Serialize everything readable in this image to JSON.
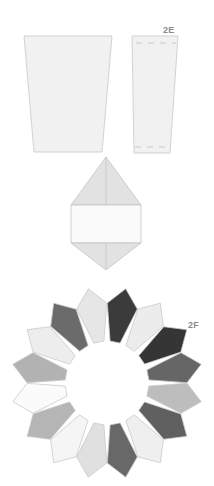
{
  "labels": {
    "fig_2e": "2E",
    "fig_2f": "2F"
  },
  "colors": {
    "template_fill": "#f1f1f1",
    "template_stroke": "#c8c8c8",
    "dashed_stroke": "#b0b0b0",
    "kite_triangle_fill": "#e2e2e2",
    "kite_band_fill": "#fafafa",
    "kite_stroke": "#c4c4c4",
    "ring_stroke": "#c9c9c9"
  },
  "templates": {
    "large_trapezoid": {
      "points": "24,36 112,36 102,152 34,152"
    },
    "narrow_trapezoid": {
      "points": "132,36 178,36 170,153 134,153"
    }
  },
  "kite": {
    "top_triangle": "106,157 141,205 71,205",
    "band": "71,205 141,205 141,243 71,243",
    "bottom_triangle": "71,243 141,243 106,270"
  },
  "ring": {
    "center": [
      107,
      383
    ],
    "piece_count": 16,
    "piece_colors": [
      "#e6e6e6",
      "#3b3b3b",
      "#ececec",
      "#353535",
      "#666666",
      "#bdbdbd",
      "#606060",
      "#efefef",
      "#686868",
      "#e0e0e0",
      "#f5f5f5",
      "#b5b5b5",
      "#fbfbfb",
      "#b2b2b2",
      "#ededed",
      "#6b6b6b"
    ]
  }
}
